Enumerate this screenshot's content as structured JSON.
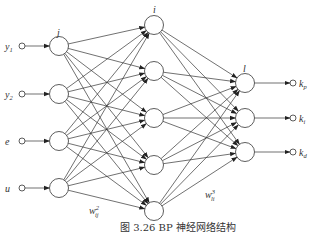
{
  "diagram": {
    "layers": {
      "input_label": "j",
      "hidden_label": "i",
      "output_label": "l"
    },
    "inputs": [
      {
        "name": "y",
        "sub": "1"
      },
      {
        "name": "y",
        "sub": "2"
      },
      {
        "name": "e",
        "sub": ""
      },
      {
        "name": "u",
        "sub": ""
      }
    ],
    "outputs": [
      {
        "name": "k",
        "sub": "p"
      },
      {
        "name": "k",
        "sub": "i"
      },
      {
        "name": "k",
        "sub": "d"
      }
    ],
    "hidden_count": 5,
    "weights": [
      {
        "name": "w",
        "sup": "2",
        "sub": "ij"
      },
      {
        "name": "w",
        "sup": "3",
        "sub": "li"
      }
    ],
    "caption": "图 3.26   BP 神经网络结构"
  }
}
